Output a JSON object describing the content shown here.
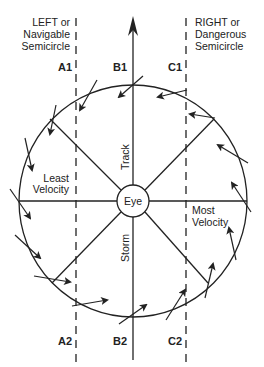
{
  "title_left": {
    "line1": "LEFT or",
    "line2": "Navigable",
    "line3": "Semicircle"
  },
  "title_right": {
    "line1": "RIGHT  or",
    "line2": "Dangerous",
    "line3": "Semicircle"
  },
  "markers": {
    "a1": "A1",
    "b1": "B1",
    "c1": "C1",
    "a2": "A2",
    "b2": "B2",
    "c2": "C2"
  },
  "center": {
    "eye": "Eye",
    "track": "Track",
    "storm": "Storm"
  },
  "zones": {
    "least1": "Least",
    "least2": "Velocity",
    "most1": "Most",
    "most2": "Velocity"
  },
  "colors": {
    "ink": "#222222",
    "background": "#ffffff"
  }
}
